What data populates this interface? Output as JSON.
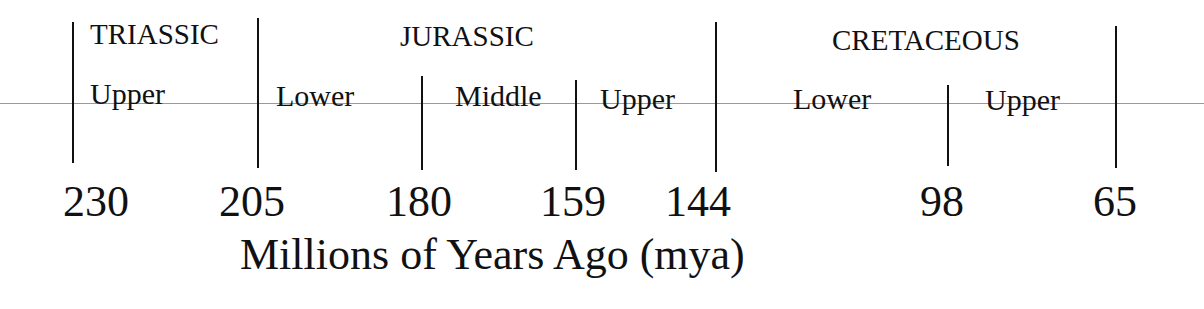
{
  "timeline": {
    "axis_title": "Millions of Years Ago (mya)",
    "periods": [
      {
        "name": "TRIASSIC",
        "x": 90,
        "y": 20
      },
      {
        "name": "JURASSIC",
        "x": 400,
        "y": 22
      },
      {
        "name": "CRETACEOUS",
        "x": 832,
        "y": 26
      }
    ],
    "epochs": [
      {
        "name": "Upper",
        "x": 90,
        "y": 79
      },
      {
        "name": "Lower",
        "x": 276,
        "y": 81
      },
      {
        "name": "Middle",
        "x": 455,
        "y": 81
      },
      {
        "name": "Upper",
        "x": 600,
        "y": 84
      },
      {
        "name": "Lower",
        "x": 793,
        "y": 84
      },
      {
        "name": "Upper",
        "x": 985,
        "y": 85
      }
    ],
    "boundaries": [
      {
        "label": "230",
        "line_x": 72,
        "top": 22,
        "bottom": 163,
        "label_x": 63
      },
      {
        "label": "205",
        "line_x": 257,
        "top": 18,
        "bottom": 168,
        "label_x": 219
      },
      {
        "label": "180",
        "line_x": 421,
        "top": 76,
        "bottom": 170,
        "label_x": 386
      },
      {
        "label": "159",
        "line_x": 575,
        "top": 80,
        "bottom": 170,
        "label_x": 540
      },
      {
        "label": "144",
        "line_x": 715,
        "top": 22,
        "bottom": 172,
        "label_x": 665
      },
      {
        "label": "98",
        "line_x": 947,
        "top": 85,
        "bottom": 166,
        "label_x": 920
      },
      {
        "label": "65",
        "line_x": 1115,
        "top": 26,
        "bottom": 168,
        "label_x": 1093
      }
    ]
  },
  "chart_data": {
    "type": "timeline",
    "title": "",
    "xlabel": "Millions of Years Ago (mya)",
    "boundaries_mya": [
      230,
      205,
      180,
      159,
      144,
      98,
      65
    ],
    "periods": [
      {
        "name": "TRIASSIC",
        "start": 230,
        "end": 205
      },
      {
        "name": "JURASSIC",
        "start": 205,
        "end": 144
      },
      {
        "name": "CRETACEOUS",
        "start": 144,
        "end": 65
      }
    ],
    "epochs": [
      {
        "period": "TRIASSIC",
        "name": "Upper",
        "start": 230,
        "end": 205
      },
      {
        "period": "JURASSIC",
        "name": "Lower",
        "start": 205,
        "end": 180
      },
      {
        "period": "JURASSIC",
        "name": "Middle",
        "start": 180,
        "end": 159
      },
      {
        "period": "JURASSIC",
        "name": "Upper",
        "start": 159,
        "end": 144
      },
      {
        "period": "CRETACEOUS",
        "name": "Lower",
        "start": 144,
        "end": 98
      },
      {
        "period": "CRETACEOUS",
        "name": "Upper",
        "start": 98,
        "end": 65
      }
    ]
  }
}
